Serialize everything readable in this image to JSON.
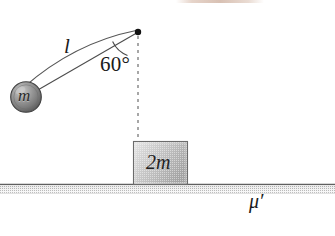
{
  "figure": {
    "background_color": "#ffffff",
    "width": 335,
    "height": 236
  },
  "labels": {
    "string_length": "l",
    "angle": "60°",
    "bob_mass": "m",
    "block_mass": "2m",
    "friction_coefficient": "μ′"
  },
  "elements": {
    "pivot": {
      "name": "pivot-point",
      "x": 138,
      "y": 32,
      "radius": 3.2,
      "color": "#101010"
    },
    "bob": {
      "name": "pendulum-bob",
      "cx": 26,
      "cy": 97,
      "r": 15.5,
      "fill_light": "#b9b9b9",
      "fill_dark": "#595959",
      "edge_color": "#3a3a3a"
    },
    "string": {
      "name": "pendulum-string",
      "from_x": 138,
      "from_y": 33,
      "to_x": 33,
      "to_y": 92,
      "color": "#4a4a4a",
      "width": 1.1
    },
    "swing_arc": {
      "name": "swing-path-arc",
      "from_x": 135,
      "from_y": 30,
      "ctrl_x": 74,
      "ctrl_y": 44,
      "to_x": 24,
      "to_y": 88,
      "color": "#555555",
      "width": 1.1
    },
    "vertical_dashed": {
      "name": "vertical-reference-line",
      "x": 138,
      "y_top": 36,
      "y_bottom": 142,
      "color": "#707070",
      "dash": "3 4"
    },
    "angle_arc": {
      "name": "angle-arc",
      "cx": 138,
      "cy": 32,
      "radius": 26,
      "color": "#4a4a4a"
    },
    "block": {
      "name": "block-2m",
      "x": 133,
      "y": 141,
      "width": 55,
      "height": 44,
      "fill_light": "#e3e3e3",
      "fill_dark": "#9a9a9a",
      "border_color": "#6e6e6e"
    },
    "ground": {
      "name": "ground-surface",
      "x": 0,
      "y": 184,
      "width": 335,
      "height": 10,
      "line_color": "#6a6a6a",
      "hatch_color": "#b6b6b6"
    },
    "top_artifact": {
      "name": "scan-artifact-strip",
      "color": "#d6bdaf"
    }
  }
}
